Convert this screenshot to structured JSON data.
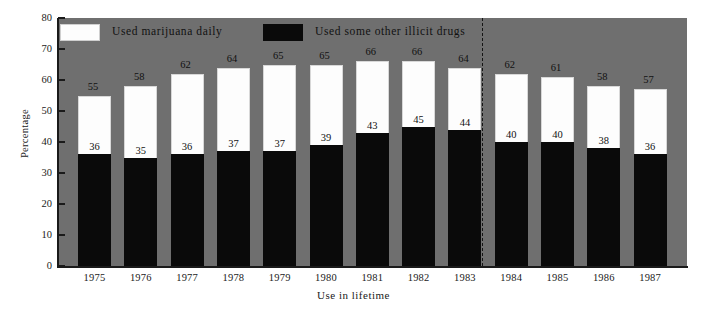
{
  "chart_data": {
    "type": "bar",
    "stacked": true,
    "title": "",
    "xlabel": "Use in lifetime",
    "ylabel": "Percentage",
    "ylim": [
      0,
      80
    ],
    "ytick_step": 10,
    "yticks": [
      "0",
      "10",
      "20",
      "30",
      "40",
      "50",
      "60",
      "70",
      "80"
    ],
    "grid": false,
    "legend_position": "top-inside",
    "plot_background": "#6f6f6f",
    "categories": [
      "1975",
      "1976",
      "1977",
      "1978",
      "1979",
      "1980",
      "1981",
      "1982",
      "1983",
      "1984",
      "1985",
      "1986",
      "1987"
    ],
    "series": [
      {
        "name": "Used some other illicit drugs",
        "color": "#0a0a0a",
        "values": [
          36,
          35,
          36,
          37,
          37,
          39,
          43,
          45,
          44,
          40,
          40,
          38,
          36
        ]
      },
      {
        "name": "Used marijuana daily",
        "color": "#fdfdfd",
        "values": [
          19,
          23,
          26,
          27,
          28,
          26,
          23,
          21,
          20,
          22,
          21,
          20,
          21
        ]
      }
    ],
    "totals": [
      55,
      58,
      62,
      64,
      65,
      65,
      66,
      66,
      64,
      62,
      61,
      58,
      57
    ],
    "annotations": {
      "divider_between": [
        "1983",
        "1984"
      ],
      "divider_style": "dashed-vertical"
    }
  },
  "legend": {
    "items": [
      {
        "label": "Used marijuana daily",
        "swatch": "white"
      },
      {
        "label": "Used some other illicit drugs",
        "swatch": "black"
      }
    ]
  },
  "axes": {
    "y_title": "Percentage",
    "x_title": "Use in lifetime"
  }
}
